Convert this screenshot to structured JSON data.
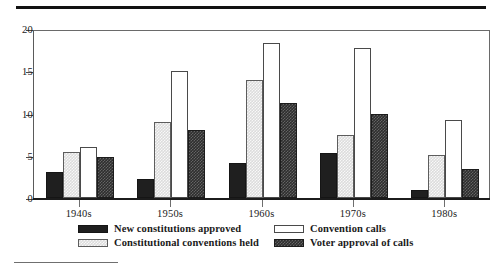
{
  "chart_data": {
    "type": "bar",
    "title": "",
    "xlabel": "",
    "ylabel": "",
    "ylim": [
      0,
      20
    ],
    "yticks": [
      0,
      5,
      10,
      15,
      20
    ],
    "ytick_labels": [
      "0",
      "5",
      "10",
      "15",
      "20"
    ],
    "grid": false,
    "legend_position": "bottom",
    "categories": [
      "1940s",
      "1950s",
      "1960s",
      "1970s",
      "1980s"
    ],
    "series": [
      {
        "name": "New constitutions approved",
        "swatch": "solid-dark",
        "color": "#1f1f1f",
        "values": [
          3.1,
          2.2,
          4.2,
          5.3,
          1.0
        ]
      },
      {
        "name": "Constitutional conventions held",
        "swatch": "light-gray",
        "color": "#dcdcdc",
        "values": [
          5.5,
          9.0,
          14.0,
          7.4,
          5.1
        ]
      },
      {
        "name": "Convention calls",
        "swatch": "white",
        "color": "#ffffff",
        "values": [
          6.0,
          15.0,
          18.3,
          17.7,
          9.2
        ]
      },
      {
        "name": "Voter approval of calls",
        "swatch": "check-dark",
        "color": "#2e2e2e",
        "values": [
          4.8,
          8.0,
          11.3,
          10.0,
          3.4
        ]
      }
    ]
  },
  "legend": {
    "items": [
      {
        "label": "New constitutions approved",
        "swatch": "solid-dark"
      },
      {
        "label": "Constitutional conventions held",
        "swatch": "light-gray"
      },
      {
        "label": "Convention calls",
        "swatch": "white"
      },
      {
        "label": "Voter approval of calls",
        "swatch": "check-dark"
      }
    ]
  }
}
